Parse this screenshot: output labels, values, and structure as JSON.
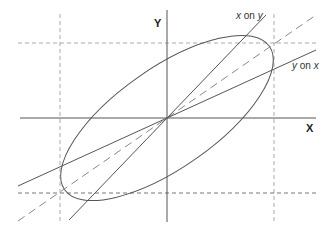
{
  "diagram": {
    "title": "",
    "axes": {
      "x_label": "X",
      "y_label": "Y"
    },
    "lines": {
      "y_on_x": {
        "label_var1": "y",
        "label_on": "on",
        "label_var2": "x"
      },
      "x_on_y": {
        "label_var1": "x",
        "label_on": "on",
        "label_var2": "y"
      }
    },
    "colors": {
      "line": "#555555",
      "dashed": "#888888",
      "gridline": "#aaaaaa",
      "text": "#333333"
    }
  }
}
